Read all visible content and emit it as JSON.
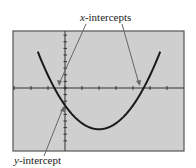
{
  "figure": {
    "annotations": {
      "x_intercepts": {
        "var": "x",
        "suffix": "-intercepts"
      },
      "y_intercept": {
        "var": "y",
        "suffix": "-intercept"
      }
    },
    "colors": {
      "screen_bg": "#cfcfcf",
      "frame": "#555555",
      "axis": "#333333",
      "curve": "#1a1a1a",
      "pointer": "#666666",
      "text": "#222222"
    }
  },
  "chart_data": {
    "type": "line",
    "title": "",
    "xlabel": "",
    "ylabel": "",
    "grid": false,
    "legend": null,
    "xlim": [
      -3,
      7
    ],
    "ylim": [
      -8,
      8.5
    ],
    "x_tick_spacing": 1,
    "y_tick_spacing": 1,
    "series": [
      {
        "name": "parabola",
        "equation": "y = (x + 0.5)(x - 4.5) approximately",
        "vertex": [
          2,
          -6.25
        ],
        "x": [
          -1.6,
          -1,
          -0.5,
          0,
          1,
          2,
          3,
          4,
          4.5,
          5,
          5.6
        ],
        "y": [
          5.5,
          2.75,
          0,
          -2.25,
          -5.25,
          -6.25,
          -5.25,
          -2.25,
          0,
          2.75,
          5.5
        ]
      }
    ],
    "annotations": [
      {
        "text": "x-intercepts",
        "points": [
          [
            -0.5,
            0
          ],
          [
            4.5,
            0
          ]
        ]
      },
      {
        "text": "y-intercept",
        "points": [
          [
            0,
            -2.25
          ]
        ]
      }
    ]
  }
}
